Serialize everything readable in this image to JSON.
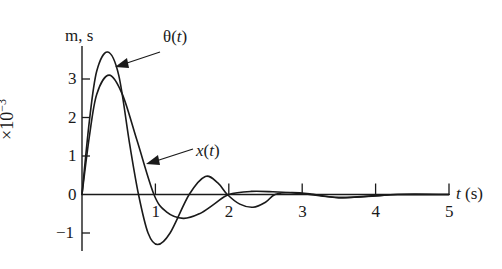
{
  "chart_data": {
    "type": "line",
    "title": "",
    "xlabel": "t (s)",
    "ylabel": "m, s",
    "yscale_label": "×10⁻³",
    "xlim": [
      0,
      5
    ],
    "ylim": [
      -1.5,
      4
    ],
    "x_ticks": [
      1,
      2,
      3,
      4,
      5
    ],
    "y_ticks": [
      -1,
      0,
      1,
      2,
      3
    ],
    "grid": false,
    "legend": "inline arrow annotations",
    "series": [
      {
        "name": "θ(t)",
        "x": [
          0,
          0.1,
          0.2,
          0.35,
          0.5,
          0.65,
          0.77,
          0.9,
          1.03,
          1.2,
          1.46,
          1.68,
          1.85,
          1.98,
          2.15,
          2.33,
          2.5,
          2.63,
          2.85,
          3.1,
          3.5,
          4.0,
          4.3,
          5.0
        ],
        "y": [
          0,
          1.9,
          3.2,
          3.7,
          3.1,
          1.3,
          0,
          -1.0,
          -1.3,
          -1.0,
          0,
          0.47,
          0.3,
          0,
          -0.25,
          -0.33,
          -0.2,
          0,
          0.05,
          0.02,
          -0.08,
          -0.03,
          0,
          0
        ]
      },
      {
        "name": "x(t)",
        "x": [
          0,
          0.1,
          0.2,
          0.37,
          0.55,
          0.75,
          0.98,
          1.15,
          1.38,
          1.6,
          1.8,
          2.0,
          2.3,
          2.6,
          3.0,
          3.5,
          4.0,
          4.3,
          5.0
        ],
        "y": [
          0,
          1.5,
          2.6,
          3.1,
          2.6,
          1.4,
          0,
          -0.45,
          -0.62,
          -0.5,
          -0.25,
          0,
          0.08,
          0.07,
          0.02,
          -0.08,
          -0.04,
          0,
          0
        ]
      }
    ],
    "annotations": [
      {
        "text": "θ(t)",
        "points_to_series": "θ(t)"
      },
      {
        "text": "x(t)",
        "points_to_series": "x(t)"
      }
    ]
  },
  "labels": {
    "y_unit": "m, s",
    "y_scale_base": "×10",
    "y_scale_exp": "−3",
    "x_axis_t": "t",
    "x_axis_unit": " (s)",
    "theta_label_sym": "θ(",
    "theta_label_var": "t",
    "theta_label_close": ")",
    "x_label_sym": "x",
    "x_label_open": "(",
    "x_label_var": "t",
    "x_label_close": ")",
    "x_ticks": [
      "1",
      "2",
      "3",
      "4",
      "5"
    ],
    "y_ticks": [
      "3",
      "2",
      "1",
      "0",
      "−1"
    ]
  }
}
